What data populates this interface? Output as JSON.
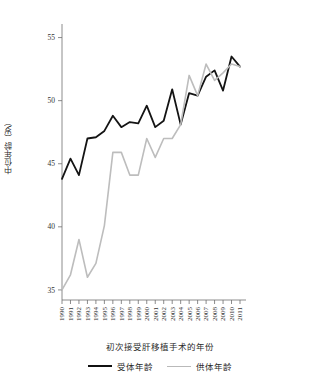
{
  "chart_data": {
    "type": "line",
    "title": "",
    "xlabel": "初次接受肝移植手术的年份",
    "ylabel": "中位年龄（岁）",
    "x": [
      1990,
      1991,
      1992,
      1993,
      1994,
      1995,
      1996,
      1997,
      1998,
      1999,
      2000,
      2001,
      2002,
      2003,
      2004,
      2005,
      2006,
      2007,
      2008,
      2009,
      2010,
      2011
    ],
    "categories": [
      "1990",
      "1991",
      "1992",
      "1993",
      "1994",
      "1995",
      "1996",
      "1997",
      "1998",
      "1999",
      "2000",
      "2001",
      "2002",
      "2003",
      "2004",
      "2005",
      "2006",
      "2007",
      "2008",
      "2009",
      "2010",
      "2011"
    ],
    "xlim": [
      1990,
      2011
    ],
    "ylim": [
      34.2,
      55.6
    ],
    "yticks": [
      35,
      40,
      45,
      50,
      55
    ],
    "ytick_labels": [
      "35",
      "40",
      "45",
      "50",
      "55"
    ],
    "grid": false,
    "legend_position": "bottom",
    "series": [
      {
        "name": "受体年龄",
        "color": "#141414",
        "width": 1.8,
        "values": [
          43.8,
          45.4,
          44.1,
          47.0,
          47.1,
          47.6,
          48.8,
          47.9,
          48.3,
          48.2,
          49.6,
          47.9,
          48.4,
          50.9,
          48.1,
          50.6,
          50.4,
          51.9,
          52.4,
          50.8,
          53.5,
          52.7
        ]
      },
      {
        "name": "供体年龄",
        "color": "#bdbdbd",
        "width": 1.6,
        "values": [
          35.0,
          36.2,
          39.0,
          36.0,
          37.1,
          40.1,
          45.9,
          45.9,
          44.1,
          44.1,
          47.0,
          45.5,
          47.0,
          47.0,
          48.1,
          52.0,
          50.4,
          52.9,
          51.6,
          52.2,
          52.9,
          52.7
        ]
      }
    ]
  },
  "legend": {
    "items": [
      {
        "label": "受体年龄",
        "color": "#141414"
      },
      {
        "label": "供体年龄",
        "color": "#bdbdbd"
      }
    ]
  }
}
